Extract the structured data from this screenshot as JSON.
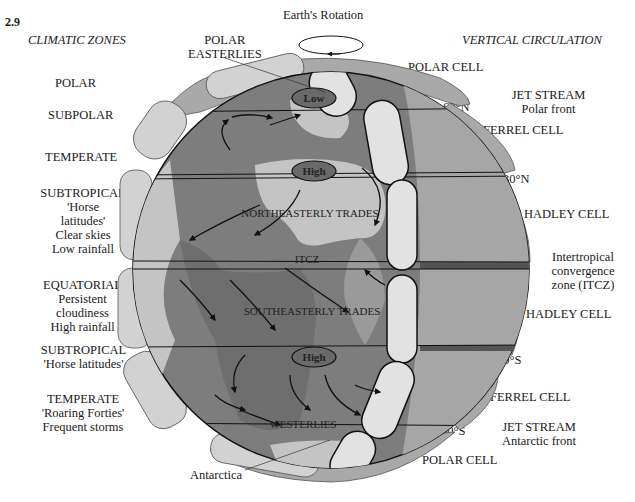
{
  "figure_number": "2.9",
  "headers": {
    "left": "CLIMATIC ZONES",
    "right": "VERTICAL CIRCULATION"
  },
  "top": {
    "rotation_label": "Earth's Rotation",
    "polar_easterlies": [
      "POLAR",
      "EASTERLIES"
    ]
  },
  "climatic_zones": [
    {
      "lines": [
        "POLAR"
      ]
    },
    {
      "lines": [
        "SUBPOLAR"
      ]
    },
    {
      "lines": [
        "TEMPERATE"
      ]
    },
    {
      "lines": [
        "SUBTROPICAL",
        "'Horse",
        "latitudes'",
        "Clear skies",
        "Low rainfall"
      ]
    },
    {
      "lines": [
        "EQUATORIAL",
        "Persistent",
        "cloudiness",
        "High rainfall"
      ]
    },
    {
      "lines": [
        "SUBTROPICAL",
        "'Horse latitudes'"
      ]
    },
    {
      "lines": [
        "TEMPERATE",
        "'Roaring Forties'",
        "Frequent storms"
      ]
    }
  ],
  "vertical_circulation": [
    {
      "lines": [
        "POLAR CELL"
      ]
    },
    {
      "lines": [
        "JET STREAM",
        "Polar front"
      ]
    },
    {
      "lines": [
        "FERREL CELL"
      ]
    },
    {
      "lines": [
        "HADLEY CELL"
      ]
    },
    {
      "lines": [
        "Intertropical",
        "convergence",
        "zone (ITCZ)"
      ]
    },
    {
      "lines": [
        "HADLEY CELL"
      ]
    },
    {
      "lines": [
        "FERREL CELL"
      ]
    },
    {
      "lines": [
        "JET STREAM",
        "Antarctic front"
      ]
    },
    {
      "lines": [
        "POLAR CELL"
      ]
    }
  ],
  "latitudes": {
    "n60": "60°N",
    "n30": "30°N",
    "eq": "0°",
    "s30": "30°S",
    "s60": "60°S"
  },
  "pressure_systems": {
    "low_north": "Low",
    "high_north": "High",
    "high_south": "High"
  },
  "wind_labels": {
    "ne_trades": "NORTHEASTERLY TRADES",
    "itcz": "ITCZ",
    "se_trades": "SOUTHEASTERLY TRADES",
    "westerlies": "WESTERLIES"
  },
  "antarctica_label": "Antarctica",
  "colors": {
    "ocean": "#7d7d7d",
    "land": "#c4c4c4",
    "band": "#a9a9a9",
    "cell_light": "#d9d9d9",
    "pressure_fill": "#6a6a6a",
    "outline": "#111111"
  }
}
